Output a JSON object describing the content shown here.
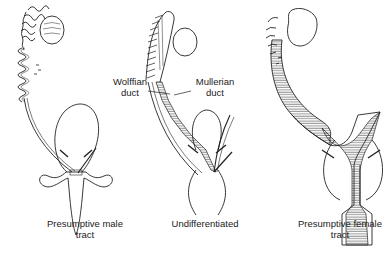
{
  "figure": {
    "panels": [
      {
        "id": "male",
        "caption": "Presumptive male\ntract"
      },
      {
        "id": "undifferentiated",
        "caption": "Undifferentiated"
      },
      {
        "id": "female",
        "caption": "Presumptive female\ntract"
      }
    ],
    "callouts": [
      {
        "id": "wolffian",
        "text": "Wolffian\nduct"
      },
      {
        "id": "mullerian",
        "text": "Mullerian\nduct"
      }
    ]
  }
}
